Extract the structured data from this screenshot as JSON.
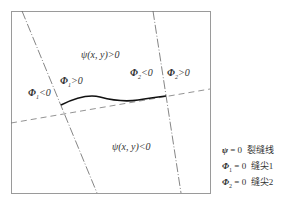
{
  "diagram": {
    "regions": {
      "psi_pos": "ψ(x, y)>0",
      "psi_neg": "ψ(x, y)<0"
    },
    "phi_labels": {
      "phi1_neg": {
        "sym": "Φ",
        "sub": "1",
        "rel": "<0"
      },
      "phi1_pos": {
        "sym": "Φ",
        "sub": "1",
        "rel": ">0"
      },
      "phi2_neg": {
        "sym": "Φ",
        "sub": "2",
        "rel": "<0"
      },
      "phi2_pos": {
        "sym": "Φ",
        "sub": "2",
        "rel": ">0"
      }
    }
  },
  "legend": [
    {
      "sym": "ψ",
      "sub": "",
      "eq": " = 0",
      "desc": "裂缝线"
    },
    {
      "sym": "Φ",
      "sub": "1",
      "eq": " = 0",
      "desc": "缝尖1"
    },
    {
      "sym": "Φ",
      "sub": "2",
      "eq": " = 0",
      "desc": "缝尖2"
    }
  ],
  "colors": {
    "frame": "#9a9a9a",
    "crack": "#111111",
    "lines": "#666666"
  }
}
